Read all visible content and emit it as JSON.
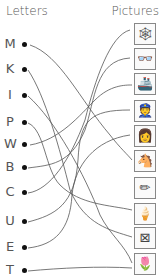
{
  "headers": {
    "letters": "Letters",
    "pictures": "Pictures"
  },
  "letters": [
    "M",
    "K",
    "I",
    "P",
    "W",
    "B",
    "C",
    "U",
    "E",
    "T"
  ],
  "pictures": [
    {
      "name": "spider-web",
      "glyph": "🕸"
    },
    {
      "name": "glasses",
      "glyph": "👓"
    },
    {
      "name": "ship",
      "glyph": "🚢"
    },
    {
      "name": "policeman",
      "glyph": "👮"
    },
    {
      "name": "woman",
      "glyph": "👩"
    },
    {
      "name": "horse",
      "glyph": "🐴"
    },
    {
      "name": "pencil",
      "glyph": "✏"
    },
    {
      "name": "ice-cream",
      "glyph": "🍦"
    },
    {
      "name": "kite",
      "glyph": "⊠"
    },
    {
      "name": "tulip",
      "glyph": "🌷"
    }
  ]
}
